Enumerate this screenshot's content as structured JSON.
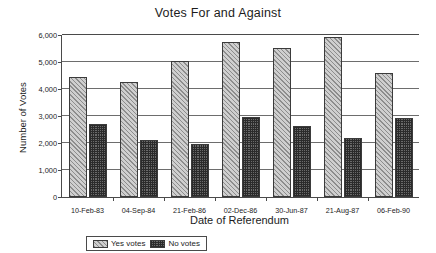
{
  "chart_data": {
    "type": "bar",
    "title": "Votes For and Against",
    "xlabel": "Date of Referendum",
    "ylabel": "Number of Votes",
    "categories": [
      "10-Feb-83",
      "04-Sep-84",
      "21-Feb-86",
      "02-Dec-86",
      "30-Jun-87",
      "21-Aug-87",
      "06-Feb-90"
    ],
    "series": [
      {
        "name": "Yes votes",
        "values": [
          4450,
          4270,
          5050,
          5750,
          5530,
          5940,
          4610
        ]
      },
      {
        "name": "No votes",
        "values": [
          2700,
          2100,
          1950,
          2950,
          2640,
          2170,
          2940
        ]
      }
    ],
    "ylim": [
      0,
      6000
    ],
    "yticks": [
      0,
      1000,
      2000,
      3000,
      4000,
      5000,
      6000
    ],
    "ytick_labels": [
      "0",
      "1,000",
      "2,000",
      "3,000",
      "4,000",
      "5,000",
      "6,000"
    ],
    "grid": "horizontal",
    "legend_position": "bottom-left",
    "colors": {
      "yes_fill": "#cfcfcf",
      "yes_hatch": "#8d8d8d",
      "no_fill": "#6a6a6a",
      "no_hatch": "#2b2b2b",
      "axis": "#4a4a4a",
      "grid": "#6d6d6d",
      "text": "#1c1c1c",
      "background": "#ffffff"
    }
  }
}
